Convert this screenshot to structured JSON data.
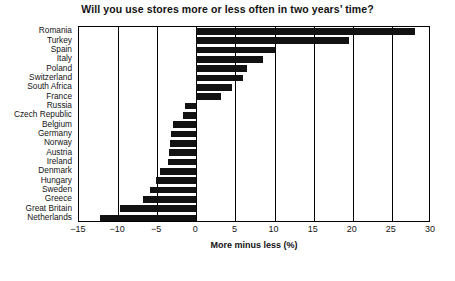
{
  "chart_data": {
    "type": "bar",
    "orientation": "horizontal",
    "title": "Will you use stores more or less often in two years’ time?",
    "xlabel": "More minus less (%)",
    "ylabel": "",
    "xlim": [
      -15,
      30
    ],
    "xticks": [
      -15,
      -10,
      -5,
      0,
      5,
      10,
      15,
      20,
      25,
      30
    ],
    "xtick_labels": [
      "−15",
      "−10",
      "−5",
      "0",
      "5",
      "10",
      "15",
      "20",
      "25",
      "30"
    ],
    "grid": "vertical",
    "legend": "none",
    "bar_color": "#121212",
    "categories": [
      "Romania",
      "Turkey",
      "Spain",
      "Italy",
      "Poland",
      "Switzerland",
      "South Africa",
      "France",
      "Russia",
      "Czech Republic",
      "Belgium",
      "Germany",
      "Norway",
      "Austria",
      "Ireland",
      "Denmark",
      "Hungary",
      "Sweden",
      "Greece",
      "Great Britain",
      "Netherlands"
    ],
    "values": [
      28.0,
      19.5,
      10.0,
      8.5,
      6.5,
      6.0,
      4.5,
      3.2,
      -1.5,
      -1.7,
      -3.0,
      -3.2,
      -3.4,
      -3.5,
      -3.6,
      -4.6,
      -5.2,
      -5.9,
      -6.8,
      -9.8,
      -12.3
    ]
  },
  "axis": {
    "zero_label": "0"
  }
}
